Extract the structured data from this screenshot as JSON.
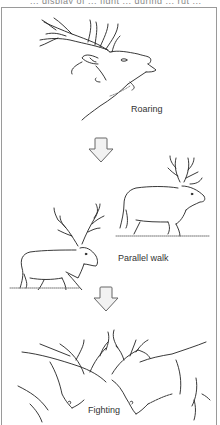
{
  "figure": {
    "top_caption_cut": "... display of ... fight ... during ... rut ...",
    "stages": [
      {
        "label": "Roaring",
        "icon": "roaring-stag-illustration"
      },
      {
        "label": "Parallel walk",
        "icon": "parallel-walk-stags-illustration"
      },
      {
        "label": "Fighting",
        "icon": "fighting-stags-illustration"
      }
    ],
    "arrows": [
      {
        "icon": "down-arrow-icon"
      },
      {
        "icon": "down-arrow-icon"
      }
    ],
    "colors": {
      "line": "#222222",
      "border": "#9a9a9a",
      "arrow_fill": "#f2f2f2",
      "arrow_stroke": "#666666"
    }
  }
}
